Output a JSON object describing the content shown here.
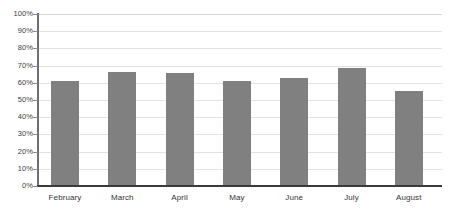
{
  "chart_data": {
    "type": "bar",
    "title": "",
    "subtitle": "",
    "xlabel": "",
    "ylabel": "",
    "categories": [
      "February",
      "March",
      "April",
      "May",
      "June",
      "July",
      "August"
    ],
    "values": [
      61,
      66,
      65.5,
      61,
      63,
      68.5,
      55.5
    ],
    "series": [
      {
        "name": "",
        "values": [
          61,
          66,
          65.5,
          61,
          63,
          68.5,
          55.5
        ]
      }
    ],
    "ylim": [
      0,
      100
    ],
    "ytick_labels": [
      "100%",
      "90%",
      "80%",
      "70%",
      "60%",
      "50%",
      "40%",
      "30%",
      "20%",
      "10%",
      "0%"
    ],
    "ytick_values": [
      100,
      90,
      80,
      70,
      60,
      50,
      40,
      30,
      20,
      10,
      0
    ],
    "grid": true,
    "legend": false,
    "legend_position": "none",
    "annotations": [],
    "colors": {
      "bar_fill": "#808080",
      "gridline": "#e2e2e2",
      "axis": "#3a3a3a",
      "axis_y": "#6e6e6e",
      "label_text": "#333333",
      "background": "#ffffff"
    }
  }
}
